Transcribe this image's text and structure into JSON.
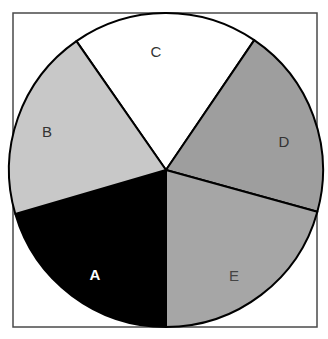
{
  "chart_data": {
    "type": "pie",
    "title": "",
    "start_angle_deg": -34.8,
    "direction": "clockwise",
    "labels_inside": true,
    "legend": "none",
    "slices": [
      {
        "label": "C",
        "start": -34.8,
        "end": 34.2,
        "value": 19.2,
        "color": "#ffffff",
        "label_color": "#333333",
        "label_pos": [
          156,
          53
        ],
        "bold": false
      },
      {
        "label": "D",
        "start": 34.2,
        "end": 105.4,
        "value": 19.8,
        "color": "#9e9e9e",
        "label_color": "#333333",
        "label_pos": [
          284,
          143
        ],
        "bold": false
      },
      {
        "label": "E",
        "start": 105.4,
        "end": 180.0,
        "value": 20.7,
        "color": "#a6a6a6",
        "label_color": "#444444",
        "label_pos": [
          234,
          277
        ],
        "bold": false
      },
      {
        "label": "A",
        "start": 180.0,
        "end": 253.7,
        "value": 20.5,
        "color": "#000000",
        "label_color": "#ffffff",
        "label_pos": [
          95,
          276
        ],
        "bold": true
      },
      {
        "label": "B",
        "start": 253.7,
        "end": 325.2,
        "value": 19.8,
        "color": "#c8c8c8",
        "label_color": "#333333",
        "label_pos": [
          47,
          133
        ],
        "bold": false
      }
    ],
    "categories": [
      "A",
      "B",
      "C",
      "D",
      "E"
    ],
    "values": [
      20.5,
      19.8,
      19.2,
      19.8,
      20.7
    ]
  },
  "layout": {
    "frame": {
      "x": 13,
      "y": 13,
      "w": 304,
      "h": 314
    },
    "center": [
      166,
      170
    ],
    "radius": 157
  }
}
